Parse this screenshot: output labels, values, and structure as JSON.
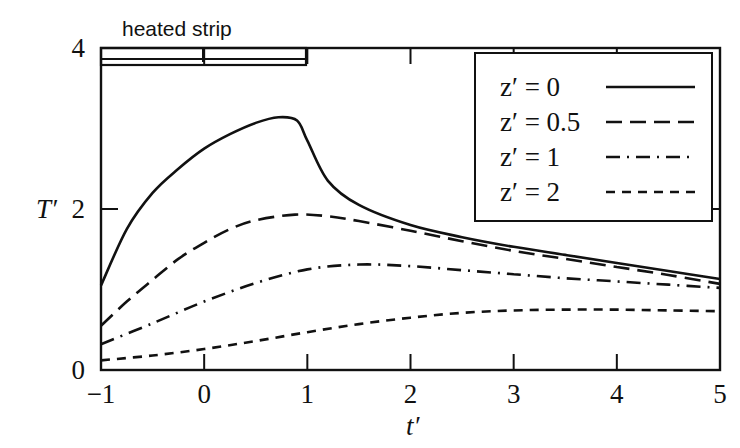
{
  "chart_data": {
    "type": "line",
    "title": "",
    "annotation": "heated strip",
    "xlabel": "t′",
    "ylabel": "T′",
    "xlim": [
      -1,
      5
    ],
    "ylim": [
      0,
      4
    ],
    "xticks": [
      "−1",
      "0",
      "1",
      "2",
      "3",
      "4",
      "5"
    ],
    "yticks": [
      "0",
      "2",
      "4"
    ],
    "grid": false,
    "legend_position": "upper right",
    "heated_strip_range": [
      -1,
      1
    ],
    "series": [
      {
        "name": "z′ = 0",
        "style": "solid",
        "x": [
          -1,
          -0.75,
          -0.5,
          -0.25,
          0,
          0.25,
          0.5,
          0.72,
          0.9,
          1.0,
          1.2,
          1.5,
          2,
          2.5,
          3,
          3.5,
          4,
          4.5,
          5
        ],
        "y": [
          1.05,
          1.75,
          2.2,
          2.5,
          2.75,
          2.93,
          3.07,
          3.14,
          3.1,
          2.85,
          2.35,
          2.05,
          1.8,
          1.65,
          1.53,
          1.43,
          1.33,
          1.23,
          1.13
        ]
      },
      {
        "name": "z′ = 0.5",
        "style": "dashed",
        "x": [
          -1,
          -0.75,
          -0.5,
          -0.25,
          0,
          0.25,
          0.5,
          0.88,
          1.2,
          1.5,
          2,
          2.5,
          3,
          3.5,
          4,
          4.5,
          5
        ],
        "y": [
          0.55,
          0.85,
          1.12,
          1.38,
          1.58,
          1.75,
          1.86,
          1.93,
          1.91,
          1.85,
          1.73,
          1.6,
          1.48,
          1.38,
          1.28,
          1.18,
          1.07
        ]
      },
      {
        "name": "z′ = 1",
        "style": "dash-dot",
        "x": [
          -1,
          -0.5,
          0,
          0.5,
          1,
          1.5,
          2,
          2.5,
          3,
          3.5,
          4,
          4.5,
          5
        ],
        "y": [
          0.32,
          0.58,
          0.85,
          1.08,
          1.25,
          1.31,
          1.29,
          1.24,
          1.19,
          1.14,
          1.1,
          1.06,
          1.02
        ]
      },
      {
        "name": "z′ = 2",
        "style": "short-dashed",
        "x": [
          -1,
          -0.5,
          0,
          0.5,
          1,
          1.5,
          2,
          2.5,
          3,
          3.5,
          4,
          4.5,
          5
        ],
        "y": [
          0.12,
          0.18,
          0.26,
          0.36,
          0.47,
          0.57,
          0.65,
          0.71,
          0.74,
          0.75,
          0.75,
          0.74,
          0.73
        ]
      }
    ]
  },
  "legend": {
    "items": [
      {
        "label": "z′ = 0"
      },
      {
        "label": "z′ = 0.5"
      },
      {
        "label": "z′ = 1"
      },
      {
        "label": "z′ = 2"
      }
    ]
  }
}
